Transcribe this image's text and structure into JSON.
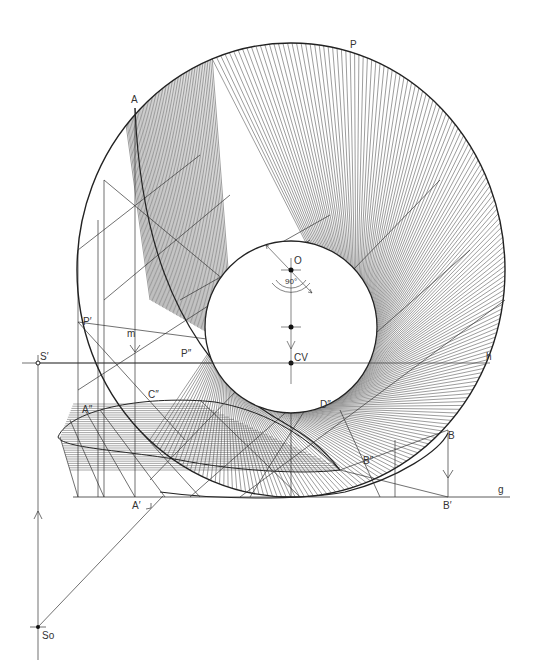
{
  "figure": {
    "colors": {
      "ink": "#222222",
      "hatch": "#3a3a3a",
      "paper": "#ffffff"
    }
  },
  "geometry": {
    "outer": {
      "cx": 291,
      "cy": 270,
      "rx": 214,
      "ry": 227
    },
    "inner": {
      "cx": 291,
      "cy": 327,
      "r": 86
    },
    "horizon_y": 363,
    "ground_y": 497,
    "S_prime": [
      38,
      363
    ],
    "S_o": [
      38,
      627
    ]
  },
  "labels": {
    "A": "A",
    "P": "P",
    "O": "O",
    "angle": "90°",
    "CV": "CV",
    "h": "h",
    "S_prime": "S′",
    "P_prime": "P′",
    "m": "m",
    "P_dprime": "P″",
    "C_dprime": "C″",
    "A_dprime": "A″",
    "D_dprime": "D″",
    "B": "B",
    "B_dprime": "B″",
    "A_prime": "A′",
    "B_prime": "B′",
    "g": "g",
    "S_o": "So"
  }
}
